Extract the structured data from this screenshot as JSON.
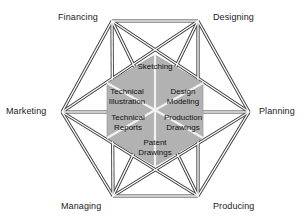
{
  "diagram": {
    "background_color": "#ffffff",
    "line_color": "#3a3a3a",
    "inner_fill_color": "#b3b3b3",
    "inner_divider_color": "#f0f0f0",
    "outer_nodes": [
      {
        "id": "financing",
        "label": "Financing",
        "position": "top-left"
      },
      {
        "id": "designing",
        "label": "Designing",
        "position": "top-right"
      },
      {
        "id": "planning",
        "label": "Planning",
        "position": "right"
      },
      {
        "id": "producing",
        "label": "Producing",
        "position": "bottom-right"
      },
      {
        "id": "managing",
        "label": "Managing",
        "position": "bottom-left"
      },
      {
        "id": "marketing",
        "label": "Marketing",
        "position": "left"
      }
    ],
    "inner_sectors": [
      {
        "id": "sketching",
        "lines": [
          "Sketching"
        ],
        "position": "top"
      },
      {
        "id": "design-modeling",
        "lines": [
          "Design",
          "Modeling"
        ],
        "position": "upper-right"
      },
      {
        "id": "production-drawings",
        "lines": [
          "Production",
          "Drawings"
        ],
        "position": "lower-right"
      },
      {
        "id": "patent-drawings",
        "lines": [
          "Patent",
          "Drawings"
        ],
        "position": "bottom"
      },
      {
        "id": "technical-reports",
        "lines": [
          "Technical",
          "Reports"
        ],
        "position": "lower-left"
      },
      {
        "id": "technical-illustration",
        "lines": [
          "Technical",
          "Illustration"
        ],
        "position": "upper-left"
      }
    ]
  }
}
